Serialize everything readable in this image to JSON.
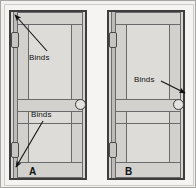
{
  "figure": {
    "type": "technical-illustration",
    "panels": [
      {
        "id": "A",
        "letter_label": "A",
        "annotations": [
          {
            "text": "Binds",
            "points_to": "top-hinge-side-corner"
          },
          {
            "text": "Binds",
            "points_to": "bottom-hinge-side-corner"
          }
        ],
        "hardware": {
          "hinges": [
            "upper-hinge",
            "lower-hinge"
          ],
          "knob": "door-knob"
        }
      },
      {
        "id": "B",
        "letter_label": "B",
        "annotations": [
          {
            "text": "Binds",
            "points_to": "latch-side-at-knob"
          }
        ],
        "hardware": {
          "hinges": [
            "upper-hinge",
            "lower-hinge"
          ],
          "knob": "door-knob"
        }
      }
    ]
  },
  "colors": {
    "outline": "#3d3d3d",
    "slab_fill": "#dddcd8",
    "rail_fill": "#d2d1cd",
    "frame_fill": "#d6d5d1",
    "background": "#f5f4f2",
    "border": "#a8a6a2",
    "text": "#111111"
  }
}
